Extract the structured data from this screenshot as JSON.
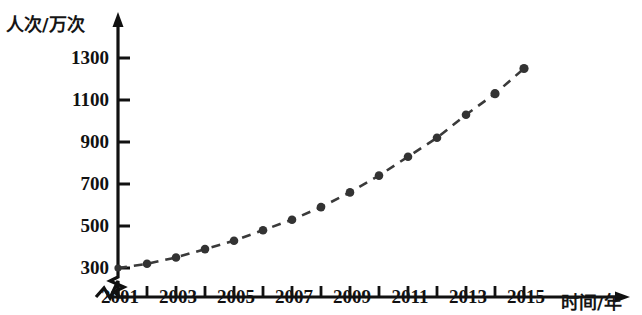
{
  "chart_data": {
    "type": "line",
    "title": "",
    "subtitle": "",
    "xlabel": "时间/年",
    "ylabel": "人次/万次",
    "x": [
      2001,
      2002,
      2003,
      2004,
      2005,
      2006,
      2007,
      2008,
      2009,
      2010,
      2011,
      2012,
      2013,
      2014,
      2015
    ],
    "values": [
      300,
      320,
      350,
      390,
      430,
      480,
      530,
      590,
      660,
      740,
      830,
      920,
      1030,
      1130,
      1250
    ],
    "series": [
      {
        "name": "人次",
        "values": [
          300,
          320,
          350,
          390,
          430,
          480,
          530,
          590,
          660,
          740,
          830,
          920,
          1030,
          1130,
          1250
        ]
      }
    ],
    "categories": [
      "2001",
      "2002",
      "2003",
      "2004",
      "2005",
      "2006",
      "2007",
      "2008",
      "2009",
      "2010",
      "2011",
      "2012",
      "2013",
      "2014",
      "2015"
    ],
    "x_tick_labels": [
      "2001",
      "2003",
      "2005",
      "2007",
      "2009",
      "2011",
      "2013",
      "2015"
    ],
    "y_tick_labels": [
      "300",
      "500",
      "700",
      "900",
      "1100",
      "1300"
    ],
    "y_tick_values": [
      300,
      500,
      700,
      900,
      1100,
      1300
    ],
    "xlim": [
      2001,
      2015
    ],
    "ylim": [
      300,
      1300
    ],
    "grid": false,
    "legend": null,
    "legend_position": "none",
    "line_style": "dashed",
    "marker": "circle",
    "series_color": "#333333",
    "axis_color": "#111111",
    "y_axis_break": true,
    "x_axis_break": true,
    "annotations": []
  },
  "axes": {
    "y_title": "人次/万次",
    "x_title": "时间/年"
  }
}
